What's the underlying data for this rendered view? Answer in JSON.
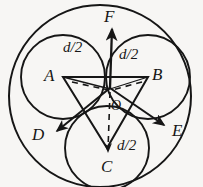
{
  "figure": {
    "background_color": "#f7f6f4",
    "stroke_color": "#161616",
    "canvas": {
      "width": 203,
      "height": 187
    },
    "outer_circle": {
      "cx": 100,
      "cy": 96,
      "r": 91
    },
    "inner_circles": [
      {
        "id": "circle-a",
        "cx": 63,
        "cy": 77,
        "r": 42
      },
      {
        "id": "circle-b",
        "cx": 148,
        "cy": 77,
        "r": 42
      },
      {
        "id": "circle-c",
        "cx": 107,
        "cy": 148,
        "r": 42
      }
    ],
    "triangle": {
      "points": "63,77 148,77 107,148"
    },
    "origin": {
      "x": 110,
      "y": 88
    }
  },
  "labels": {
    "vertex_a": "A",
    "vertex_b": "B",
    "vertex_c": "C",
    "ray_d": "D",
    "ray_e": "E",
    "ray_f": "F",
    "center_o": "O",
    "dim_left": "d/2",
    "dim_right": "d/2",
    "dim_bottom": "d/2"
  },
  "vectors": [
    {
      "name": "vector-f",
      "label": "F",
      "from": [
        110,
        88
      ],
      "to": [
        112,
        28
      ],
      "style": "solid-arrow"
    },
    {
      "name": "vector-d",
      "label": "D",
      "from": [
        110,
        88
      ],
      "to": [
        55,
        133
      ],
      "style": "solid-arrow"
    },
    {
      "name": "vector-e",
      "label": "E",
      "from": [
        110,
        88
      ],
      "to": [
        166,
        126
      ],
      "style": "solid-arrow"
    },
    {
      "name": "vector-oc",
      "label": "",
      "from": [
        110,
        92
      ],
      "to": [
        108,
        152
      ],
      "style": "dashed-arrow"
    }
  ]
}
